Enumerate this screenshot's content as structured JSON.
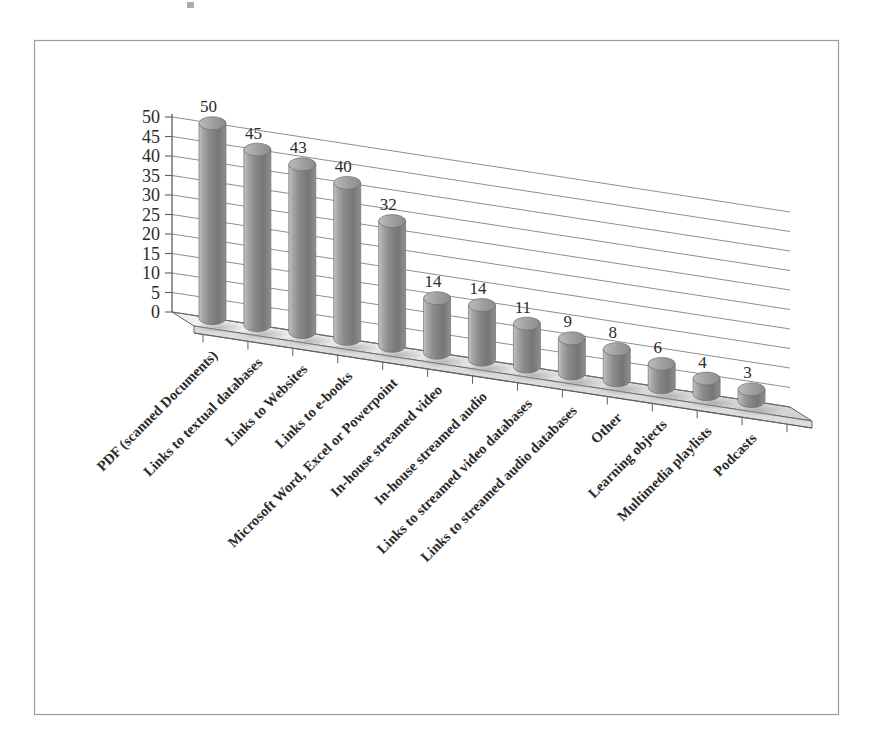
{
  "document": {
    "kind": "scanned-figure",
    "background_color": "#ffffff",
    "frame_border_color": "#9a9a9a"
  },
  "chart_data": {
    "type": "bar",
    "render_style": "3d-cylinder-perspective",
    "title": "",
    "subtitle": "",
    "xlabel": "",
    "ylabel": "",
    "ylim": [
      0,
      50
    ],
    "grid": true,
    "legend": null,
    "legend_position": "none",
    "y_ticks": [
      0,
      5,
      10,
      15,
      20,
      25,
      30,
      35,
      40,
      45,
      50
    ],
    "categories": [
      "PDF (scanned Documents)",
      "Links to textual databases",
      "Links to Websites",
      "Links to e-books",
      "Microsoft Word, Excel or Powerpoint",
      "In-house streamed video",
      "In-house streamed audio",
      "Links to streamed video databases",
      "Links to streamed audio databases",
      "Other",
      "Learning objects",
      "Multimedia playlists",
      "Podcasts"
    ],
    "values": [
      50,
      45,
      43,
      40,
      32,
      14,
      14,
      11,
      9,
      8,
      6,
      4,
      3
    ],
    "data_labels": [
      "50",
      "45",
      "43",
      "40",
      "32",
      "14",
      "14",
      "11",
      "9",
      "8",
      "6",
      "4",
      "3"
    ],
    "series": [
      {
        "name": "",
        "values": [
          50,
          45,
          43,
          40,
          32,
          14,
          14,
          11,
          9,
          8,
          6,
          4,
          3
        ]
      }
    ],
    "colors": {
      "bar_light": "#b9b9b9",
      "bar_mid": "#8d8d8d",
      "bar_dark": "#6f6f6f",
      "bar_top": "#a6a6a6",
      "gridline": "#6d6d6d",
      "axis": "#5f5f5f",
      "floor": "#e9e9e9",
      "text": "#2b2b2b"
    },
    "category_label_rotation_deg": -45
  }
}
